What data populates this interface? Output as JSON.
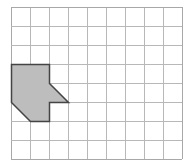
{
  "diagram": {
    "type": "grid-shape",
    "grid": {
      "columns": 9,
      "rows": 8,
      "origin_px": [
        11,
        7
      ],
      "cell_px": 19,
      "line_color": "#b8b8b8",
      "border_color": "#a8a8a8"
    },
    "shape": {
      "name": "shaded-polygon",
      "fill": "#bdbdbd",
      "stroke": "#444444",
      "vertices_grid": [
        [
          0,
          3
        ],
        [
          2,
          3
        ],
        [
          2,
          4
        ],
        [
          3,
          5
        ],
        [
          2,
          5
        ],
        [
          2,
          6
        ],
        [
          1,
          6
        ],
        [
          0,
          5
        ]
      ]
    }
  }
}
